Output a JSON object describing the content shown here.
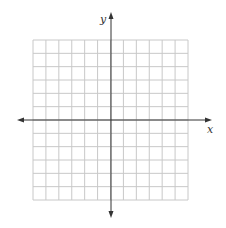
{
  "diagram": {
    "type": "coordinate-plane",
    "x_axis_label": "x",
    "y_axis_label": "y",
    "grid": {
      "columns": 12,
      "rows": 12,
      "left": 33,
      "top": 40,
      "right": 188,
      "bottom": 200,
      "line_color": "#c8c8c8"
    },
    "axes": {
      "origin_x": 111,
      "origin_y": 120,
      "x_start": 17,
      "x_end": 212,
      "y_start": 12,
      "y_end": 218,
      "color": "#333333"
    }
  }
}
